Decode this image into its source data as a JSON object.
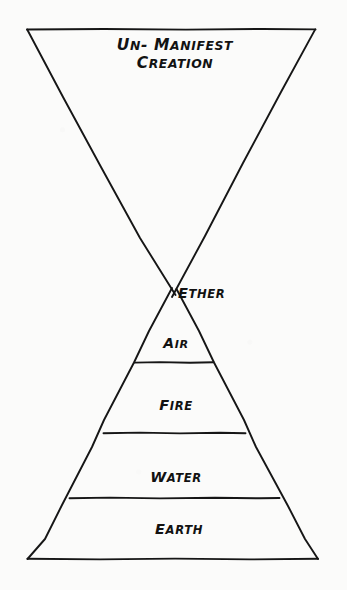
{
  "diagram": {
    "title_block": {
      "line1": "Un- Manifest",
      "line2": "Creation"
    },
    "upper_region_label": "Un- Manifest Creation",
    "background_color": "#fbfbfa",
    "ink_color": "#161616",
    "elements": [
      {
        "label": "Ether",
        "order": 1,
        "position": "apex"
      },
      {
        "label": "Air",
        "order": 2,
        "position": "band"
      },
      {
        "label": "Fire",
        "order": 3,
        "position": "band"
      },
      {
        "label": "Water",
        "order": 4,
        "position": "band"
      },
      {
        "label": "Earth",
        "order": 5,
        "position": "band"
      }
    ]
  },
  "chart_data": {
    "type": "diagram",
    "title": "Un- Manifest Creation",
    "shapes": [
      {
        "name": "upper-inverted-triangle",
        "label": "Un- Manifest Creation",
        "points": [
          [
            27,
            29
          ],
          [
            315,
            29
          ],
          [
            175,
            295
          ]
        ]
      },
      {
        "name": "lower-upright-triangle",
        "label": "Five Elements",
        "points": [
          [
            175,
            295
          ],
          [
            318,
            559
          ],
          [
            27,
            559
          ]
        ]
      }
    ],
    "bands": [
      {
        "label": "Ether",
        "y_top": 295,
        "y_bottom": 338
      },
      {
        "label": "Air",
        "y_top": 338,
        "y_bottom": 363
      },
      {
        "label": "Fire",
        "y_top": 363,
        "y_bottom": 433
      },
      {
        "label": "Water",
        "y_top": 433,
        "y_bottom": 498
      },
      {
        "label": "Earth",
        "y_top": 498,
        "y_bottom": 559
      }
    ],
    "divider_y": [
      363,
      433,
      498
    ],
    "apex": [
      175,
      295
    ],
    "categories": [
      "Ether",
      "Air",
      "Fire",
      "Water",
      "Earth"
    ],
    "values": [
      43,
      25,
      70,
      65,
      61
    ],
    "xlabel": "",
    "ylabel": "",
    "legend": []
  }
}
